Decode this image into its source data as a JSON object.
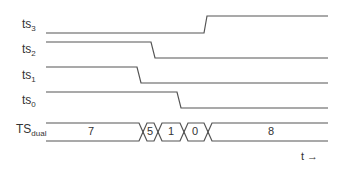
{
  "signals": [
    {
      "name": "ts",
      "sub": "3"
    },
    {
      "name": "ts",
      "sub": "2"
    },
    {
      "name": "ts",
      "sub": "1"
    },
    {
      "name": "ts",
      "sub": "0"
    }
  ],
  "bus": {
    "name": "TS",
    "sub": "dual",
    "values": [
      "7",
      "5",
      "1",
      "0",
      "8"
    ]
  },
  "time_label": "t →",
  "colors": {
    "line": "#555555"
  }
}
